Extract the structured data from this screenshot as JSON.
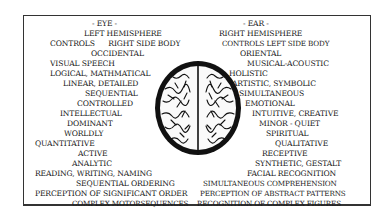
{
  "diagram": {
    "left": {
      "heading": "- EYE -",
      "lines": [
        "LEFT HEMISPHERE",
        "CONTROLS      RIGHT SIDE BODY",
        "OCCIDENTAL",
        "VISUAL SPEECH",
        "LOGICAL, MATHMATICAL",
        "LINEAR, DETAILED",
        "SEQUENTIAL",
        "CONTROLLED",
        "INTELLECTUAL",
        "DOMINANT",
        "WORLDLY",
        "QUANTITATIVE",
        "ACTIVE",
        "ANALYTIC",
        "READING, WRITING, NAMING",
        "SEQUENTIAL ORDERING",
        "PERCEPTION OF SIGNIFICANT ORDER",
        "COMPLEX MOTORSEQUENCES"
      ]
    },
    "right": {
      "heading": "- EAR -",
      "lines": [
        "RIGHT HEMISPHERE",
        "CONTROLS LEFT SIDE BODY",
        "ORIENTAL",
        "MUSICAL-ACOUSTIC",
        "HOLISTIC",
        "ARTISTIC, SYMBOLIC",
        "SIMULTANEOUS",
        "EMOTIONAL",
        "INTUITIVE, CREATIVE",
        "MINOR - QUIET",
        "SPIRITUAL",
        "QUALITATIVE",
        "RECEPTIVE",
        "SYNTHETIC, GESTALT",
        "FACIAL RECOGNITION",
        "SIMULTANEOUS COMPREHENSION",
        "PERCEPTION OF ABSTRACT PATTERNS",
        "RECOGNITION OF COMPLEX FIGURES"
      ]
    },
    "center_image": "brain-top-view-illustration"
  }
}
